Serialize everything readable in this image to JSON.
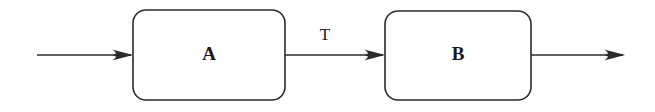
{
  "diagram": {
    "background_color": "#ffffff",
    "stroke_color": "#2b2b2b",
    "text_color": "#1a1a1a",
    "blocks": [
      {
        "id": "A",
        "label": "A",
        "shape": "rounded-rectangle",
        "x": 133,
        "y": 10,
        "width": 152,
        "height": 90,
        "corner_radius": 13
      },
      {
        "id": "B",
        "label": "B",
        "shape": "rounded-rectangle",
        "x": 385,
        "y": 11,
        "width": 146,
        "height": 89,
        "corner_radius": 13
      }
    ],
    "edges": [
      {
        "id": "input",
        "label": "",
        "from": "",
        "to": "A",
        "x1": 37,
        "x2": 133,
        "y": 55,
        "arrowhead": "end"
      },
      {
        "id": "a-to-b",
        "label": "T",
        "label_x": 325,
        "label_y": 36,
        "from": "A",
        "to": "B",
        "x1": 285,
        "x2": 385,
        "y": 55,
        "arrowhead": "end"
      },
      {
        "id": "output",
        "label": "",
        "from": "B",
        "to": "",
        "x1": 531,
        "x2": 625,
        "y": 55,
        "arrowhead": "end"
      }
    ]
  }
}
